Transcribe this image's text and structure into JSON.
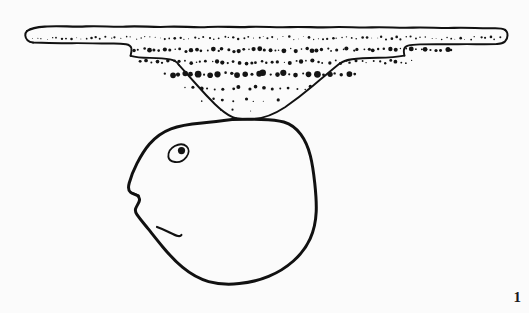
{
  "figure": {
    "caption_number": "1",
    "kind": "archaeological-line-drawing",
    "background_color": "#fbfbfb",
    "ink_color": "#111111",
    "width": 529,
    "height": 313,
    "parts": [
      {
        "name": "vessel-profile",
        "label": "pottery vessel section with stippled fabric",
        "description": "Wide flat rim band spanning the image, stepping down on both sides to a deep V-shaped body that converges to a point."
      },
      {
        "name": "face-outline",
        "label": "rounded head / face outline",
        "description": "Large rounded blob shape below the vessel, drawn with an eye, a pointed nose at the left and a short mouth stroke."
      }
    ]
  },
  "vessel": {
    "rim": {
      "left_x": 27,
      "right_x": 505,
      "top_y": 26,
      "bottom_y": 44
    },
    "shoulder_left_x": 128,
    "shoulder_right_x": 404,
    "apex": {
      "x": 236,
      "y": 118
    },
    "stipple_rows": [
      {
        "y": 38,
        "x_start": 32,
        "x_end": 500,
        "count": 96,
        "radius": 0.8
      },
      {
        "y": 50,
        "x_start": 134,
        "x_end": 452,
        "count": 62,
        "radius": 1.5
      },
      {
        "y": 62,
        "x_start": 140,
        "x_end": 412,
        "count": 50,
        "radius": 1.3
      },
      {
        "y": 74,
        "x_start": 166,
        "x_end": 356,
        "count": 30,
        "radius": 2.0
      },
      {
        "y": 88,
        "x_start": 184,
        "x_end": 312,
        "count": 17,
        "radius": 1.2
      },
      {
        "y": 100,
        "x_start": 204,
        "x_end": 276,
        "count": 8,
        "radius": 1.1
      },
      {
        "y": 110,
        "x_start": 222,
        "x_end": 248,
        "count": 3,
        "radius": 1.0
      }
    ]
  },
  "face": {
    "eye": {
      "cx": 178,
      "cy": 152,
      "rx": 9,
      "ry": 7,
      "pupil_r": 3.4
    },
    "nose_tip": {
      "x": 131,
      "y": 188
    },
    "mouth_start": {
      "x": 158,
      "y": 228
    },
    "bounds": {
      "left": 128,
      "right": 316,
      "top": 119,
      "bottom": 284
    }
  }
}
